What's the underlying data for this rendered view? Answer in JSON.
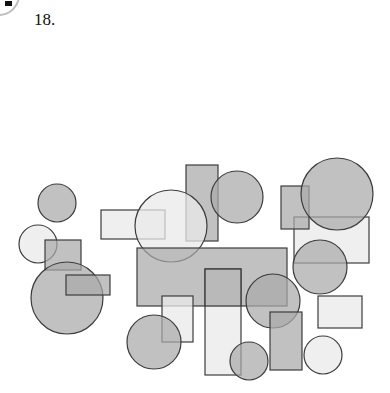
{
  "question": {
    "number": "18."
  },
  "colors": {
    "light": "#e9e9e9",
    "mid": "#a9a9a9",
    "stroke": "#3c3c3c"
  },
  "figure": {
    "shapes": [
      {
        "type": "rect",
        "x": 101,
        "y": 210,
        "w": 64,
        "h": 29,
        "fill": "light"
      },
      {
        "type": "rect",
        "x": 186,
        "y": 165,
        "w": 32,
        "h": 76,
        "fill": "mid"
      },
      {
        "type": "circle",
        "cx": 171,
        "cy": 226,
        "r": 36,
        "fill": "light"
      },
      {
        "type": "circle",
        "cx": 237,
        "cy": 197,
        "r": 26,
        "fill": "mid"
      },
      {
        "type": "circle",
        "cx": 57,
        "cy": 203,
        "r": 19,
        "fill": "mid"
      },
      {
        "type": "circle",
        "cx": 38,
        "cy": 244,
        "r": 19,
        "fill": "light"
      },
      {
        "type": "rect",
        "x": 45,
        "y": 240,
        "w": 36,
        "h": 30,
        "fill": "mid"
      },
      {
        "type": "circle",
        "cx": 67,
        "cy": 298,
        "r": 36,
        "fill": "mid"
      },
      {
        "type": "rect",
        "x": 66,
        "y": 275,
        "w": 44,
        "h": 20,
        "fill": "mid"
      },
      {
        "type": "rect",
        "x": 137,
        "y": 248,
        "w": 150,
        "h": 58,
        "fill": "mid"
      },
      {
        "type": "rect",
        "x": 294,
        "y": 217,
        "w": 75,
        "h": 46,
        "fill": "light"
      },
      {
        "type": "rect",
        "x": 281,
        "y": 186,
        "w": 28,
        "h": 43,
        "fill": "mid"
      },
      {
        "type": "circle",
        "cx": 337,
        "cy": 194,
        "r": 36,
        "fill": "mid"
      },
      {
        "type": "circle",
        "cx": 320,
        "cy": 267,
        "r": 27,
        "fill": "mid"
      },
      {
        "type": "rect",
        "x": 318,
        "y": 296,
        "w": 44,
        "h": 32,
        "fill": "light"
      },
      {
        "type": "rect",
        "x": 162,
        "y": 296,
        "w": 31,
        "h": 46,
        "fill": "light"
      },
      {
        "type": "circle",
        "cx": 154,
        "cy": 342,
        "r": 27,
        "fill": "mid"
      },
      {
        "type": "rect",
        "x": 205,
        "y": 269,
        "w": 36,
        "h": 106,
        "fill": "light"
      },
      {
        "type": "rect",
        "x": 205,
        "y": 269,
        "w": 36,
        "h": 37,
        "fill": "mid"
      },
      {
        "type": "circle",
        "cx": 273,
        "cy": 301,
        "r": 27,
        "fill": "mid"
      },
      {
        "type": "rect",
        "x": 270,
        "y": 312,
        "w": 32,
        "h": 58,
        "fill": "mid"
      },
      {
        "type": "circle",
        "cx": 249,
        "cy": 361,
        "r": 19,
        "fill": "mid"
      },
      {
        "type": "circle",
        "cx": 323,
        "cy": 355,
        "r": 19,
        "fill": "light"
      }
    ]
  }
}
